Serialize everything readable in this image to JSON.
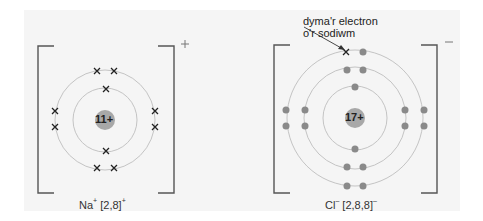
{
  "diagram": {
    "background_panel_color": "#f5f5f5",
    "ring_color": "#bdbdbd",
    "bracket_color": "#555555",
    "nucleus_color": "#a8a8a8",
    "electron_dot_color": "#8a8a8a",
    "electron_cross_color": "#222222",
    "callout": {
      "line1": "dyma'r electron",
      "line2": "o'r sodiwm"
    },
    "sodium_ion": {
      "nucleus_label": "11+",
      "charge_sign": "+",
      "symbol": "Na",
      "symbol_superscript": "+",
      "configuration": "[2,8]",
      "config_superscript": "+",
      "shells": [
        2,
        8
      ],
      "electron_marker": "cross"
    },
    "chloride_ion": {
      "nucleus_label": "17+",
      "charge_sign": "–",
      "symbol": "Cl",
      "symbol_superscript": "–",
      "configuration": "[2,8,8]",
      "config_superscript": "–",
      "shells": [
        2,
        8,
        8
      ],
      "electron_marker": "dot",
      "transferred_electron_marker": "cross"
    }
  }
}
